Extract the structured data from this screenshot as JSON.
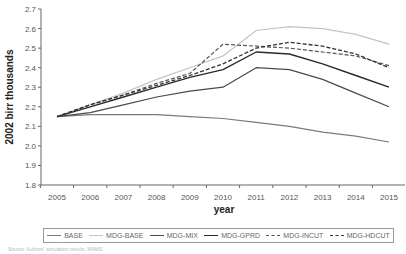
{
  "chart_data": {
    "type": "line",
    "title": "",
    "xlabel": "year",
    "ylabel": "2002 birr thousands",
    "ylim": [
      1.8,
      2.7
    ],
    "yticks": [
      "1.8",
      "1.9",
      "2.0",
      "2.1",
      "2.2",
      "2.3",
      "2.4",
      "2.5",
      "2.6",
      "2.7"
    ],
    "x": [
      "2005",
      "2006",
      "2007",
      "2008",
      "2009",
      "2010",
      "2011",
      "2012",
      "2013",
      "2014",
      "2015"
    ],
    "grid": false,
    "legend_position": "bottom",
    "series": [
      {
        "name": "BASE",
        "color": "#7a7a7a",
        "dash": "solid",
        "width": 1.2,
        "values": [
          2.15,
          2.16,
          2.16,
          2.16,
          2.15,
          2.14,
          2.12,
          2.1,
          2.07,
          2.05,
          2.02
        ]
      },
      {
        "name": "MDG-BASE",
        "color": "#c4c4c4",
        "dash": "solid",
        "width": 1.2,
        "values": [
          2.15,
          2.21,
          2.27,
          2.34,
          2.4,
          2.46,
          2.59,
          2.61,
          2.6,
          2.57,
          2.52
        ]
      },
      {
        "name": "MDG-MIX",
        "color": "#4a4a4a",
        "dash": "solid",
        "width": 1.2,
        "values": [
          2.15,
          2.17,
          2.21,
          2.25,
          2.28,
          2.3,
          2.4,
          2.39,
          2.34,
          2.27,
          2.2
        ]
      },
      {
        "name": "MDG-GPRD",
        "color": "#2a2a2a",
        "dash": "solid",
        "width": 1.4,
        "values": [
          2.15,
          2.2,
          2.25,
          2.3,
          2.35,
          2.39,
          2.48,
          2.47,
          2.42,
          2.36,
          2.3
        ]
      },
      {
        "name": "MDG-INCUT",
        "color": "#555555",
        "dash": "4,2",
        "width": 1.2,
        "values": [
          2.15,
          2.21,
          2.26,
          2.32,
          2.37,
          2.52,
          2.51,
          2.5,
          2.48,
          2.46,
          2.41
        ]
      },
      {
        "name": "MDG-HDCUT",
        "color": "#333333",
        "dash": "4,2",
        "width": 1.3,
        "values": [
          2.15,
          2.21,
          2.26,
          2.31,
          2.36,
          2.42,
          2.5,
          2.53,
          2.51,
          2.47,
          2.4
        ]
      }
    ]
  },
  "axis": {
    "ylabel": "2002 birr thousands",
    "xlabel": "year"
  },
  "source_note": "Source: Authors' simulation results, MAMS"
}
